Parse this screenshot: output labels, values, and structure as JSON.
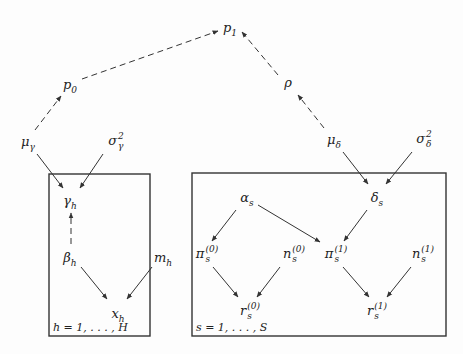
{
  "diagram": {
    "type": "graphical-model",
    "nodes": [
      {
        "id": "p1",
        "base": "p",
        "sub": "1",
        "sup": "",
        "x": 230,
        "y": 27
      },
      {
        "id": "p0",
        "base": "p",
        "sub": "0",
        "sup": "",
        "x": 70,
        "y": 84
      },
      {
        "id": "rho",
        "base": "ρ",
        "sub": "",
        "sup": "",
        "x": 288,
        "y": 82
      },
      {
        "id": "mu_gamma",
        "base": "μ",
        "sub": "γ",
        "sup": "",
        "x": 28,
        "y": 141
      },
      {
        "id": "sigma2_gamma",
        "base": "σ",
        "sub": "γ",
        "sup": "2",
        "x": 116,
        "y": 141
      },
      {
        "id": "mu_delta",
        "base": "μ",
        "sub": "δ",
        "sup": "",
        "x": 334,
        "y": 139
      },
      {
        "id": "sigma2_delta",
        "base": "σ",
        "sub": "δ",
        "sup": "2",
        "x": 424,
        "y": 139
      },
      {
        "id": "gamma_h",
        "base": "γ",
        "sub": "h",
        "sup": "",
        "x": 70,
        "y": 200
      },
      {
        "id": "beta_h",
        "base": "β",
        "sub": "h",
        "sup": "",
        "x": 70,
        "y": 257
      },
      {
        "id": "m_h",
        "base": "m",
        "sub": "h",
        "sup": "",
        "x": 163,
        "y": 257
      },
      {
        "id": "x_h",
        "base": "x",
        "sub": "h",
        "sup": "",
        "x": 118,
        "y": 313
      },
      {
        "id": "alpha_s",
        "base": "α",
        "sub": "s",
        "sup": "",
        "x": 247,
        "y": 197
      },
      {
        "id": "delta_s",
        "base": "δ",
        "sub": "s",
        "sup": "",
        "x": 377,
        "y": 197
      },
      {
        "id": "pi0_s",
        "base": "π",
        "sub": "s",
        "sup": "(0)",
        "x": 207,
        "y": 254
      },
      {
        "id": "n0_s",
        "base": "n",
        "sub": "s",
        "sup": "(0)",
        "x": 294,
        "y": 254
      },
      {
        "id": "pi1_s",
        "base": "π",
        "sub": "s",
        "sup": "(1)",
        "x": 336,
        "y": 254
      },
      {
        "id": "n1_s",
        "base": "n",
        "sub": "s",
        "sup": "(1)",
        "x": 423,
        "y": 254
      },
      {
        "id": "r0_s",
        "base": "r",
        "sub": "s",
        "sup": "(0)",
        "x": 250,
        "y": 311
      },
      {
        "id": "r1_s",
        "base": "r",
        "sub": "s",
        "sup": "(1)",
        "x": 377,
        "y": 311
      }
    ],
    "edges": [
      {
        "from": "p0",
        "to": "p1",
        "style": "dashed",
        "x1": 82,
        "y1": 79,
        "x2": 218,
        "y2": 31
      },
      {
        "from": "rho",
        "to": "p1",
        "style": "dashed",
        "x1": 278,
        "y1": 75,
        "x2": 242,
        "y2": 32
      },
      {
        "from": "mu_gamma",
        "to": "p0",
        "style": "dashed",
        "x1": 35,
        "y1": 130,
        "x2": 61,
        "y2": 96
      },
      {
        "from": "mu_delta",
        "to": "rho",
        "style": "dashed",
        "x1": 324,
        "y1": 128,
        "x2": 298,
        "y2": 95
      },
      {
        "from": "mu_gamma",
        "to": "gamma_h",
        "style": "solid",
        "x1": 37,
        "y1": 154,
        "x2": 63,
        "y2": 188
      },
      {
        "from": "sigma2_gamma",
        "to": "gamma_h",
        "style": "solid",
        "x1": 103,
        "y1": 154,
        "x2": 80,
        "y2": 188
      },
      {
        "from": "beta_h",
        "to": "gamma_h",
        "style": "dashed",
        "x1": 71,
        "y1": 244,
        "x2": 71,
        "y2": 213
      },
      {
        "from": "beta_h",
        "to": "x_h",
        "style": "solid",
        "x1": 81,
        "y1": 267,
        "x2": 107,
        "y2": 299
      },
      {
        "from": "m_h",
        "to": "x_h",
        "style": "solid",
        "x1": 152,
        "y1": 267,
        "x2": 127,
        "y2": 299
      },
      {
        "from": "mu_delta",
        "to": "delta_s",
        "style": "solid",
        "x1": 343,
        "y1": 152,
        "x2": 368,
        "y2": 184
      },
      {
        "from": "sigma2_delta",
        "to": "delta_s",
        "style": "solid",
        "x1": 412,
        "y1": 152,
        "x2": 386,
        "y2": 184
      },
      {
        "from": "alpha_s",
        "to": "pi0_s",
        "style": "solid",
        "x1": 236,
        "y1": 210,
        "x2": 212,
        "y2": 241
      },
      {
        "from": "alpha_s",
        "to": "pi1_s",
        "style": "solid",
        "x1": 258,
        "y1": 205,
        "x2": 320,
        "y2": 242
      },
      {
        "from": "delta_s",
        "to": "pi1_s",
        "style": "solid",
        "x1": 367,
        "y1": 210,
        "x2": 344,
        "y2": 241
      },
      {
        "from": "pi0_s",
        "to": "r0_s",
        "style": "solid",
        "x1": 213,
        "y1": 267,
        "x2": 238,
        "y2": 297
      },
      {
        "from": "n0_s",
        "to": "r0_s",
        "style": "solid",
        "x1": 280,
        "y1": 267,
        "x2": 257,
        "y2": 297
      },
      {
        "from": "pi1_s",
        "to": "r1_s",
        "style": "solid",
        "x1": 343,
        "y1": 267,
        "x2": 369,
        "y2": 297
      },
      {
        "from": "n1_s",
        "to": "r1_s",
        "style": "solid",
        "x1": 411,
        "y1": 267,
        "x2": 387,
        "y2": 297
      }
    ],
    "plates": [
      {
        "id": "plate_h",
        "label": "h = 1, . . . , H",
        "x": 49,
        "y": 174,
        "w": 101,
        "h": 162
      },
      {
        "id": "plate_s",
        "label": "s = 1, . . . , S",
        "x": 192,
        "y": 173,
        "w": 254,
        "h": 163
      }
    ]
  }
}
